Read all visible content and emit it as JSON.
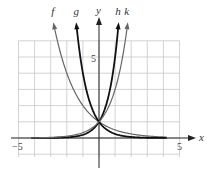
{
  "chart_data": {
    "type": "line",
    "title": "",
    "xlabel": "x",
    "ylabel": "y",
    "xlim": [
      -5,
      5
    ],
    "ylim": [
      -1,
      6
    ],
    "grid": true,
    "tick_labels": {
      "x_min": "−5",
      "x_max": "5",
      "y_tick": "5"
    },
    "series": [
      {
        "name": "f",
        "formula": "(1/2)^x",
        "base": 0.5,
        "color": "#666666",
        "width": 1.2
      },
      {
        "name": "g",
        "formula": "(1/4)^x",
        "base": 0.25,
        "color": "#111111",
        "width": 1.8
      },
      {
        "name": "h",
        "formula": "5^x",
        "base": 5,
        "color": "#111111",
        "width": 1.8
      },
      {
        "name": "k",
        "formula": "3^x",
        "base": 3,
        "color": "#666666",
        "width": 1.2
      }
    ],
    "annotations": [
      "All curves pass through (0, 1)"
    ]
  }
}
